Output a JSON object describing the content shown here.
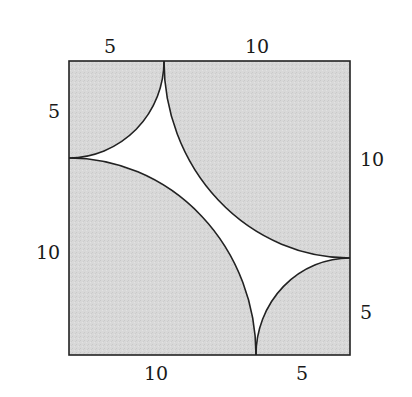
{
  "figure": {
    "type": "geometry-diagram",
    "colors": {
      "shade": "#d6d6d6",
      "stroke": "#222222",
      "background": "#ffffff",
      "label": "#1a1a1a"
    },
    "labels": {
      "top_left": "5",
      "top_right": "10",
      "left_top": "5",
      "left_bottom": "10",
      "right_top": "10",
      "right_bottom": "5",
      "bottom_left": "10",
      "bottom_right": "5"
    },
    "quarter_circles": [
      {
        "corner": "top-left",
        "radius": "5"
      },
      {
        "corner": "top-right",
        "radius": "10"
      },
      {
        "corner": "bottom-left",
        "radius": "10"
      },
      {
        "corner": "bottom-right",
        "radius": "5"
      }
    ],
    "square_side": "15"
  }
}
